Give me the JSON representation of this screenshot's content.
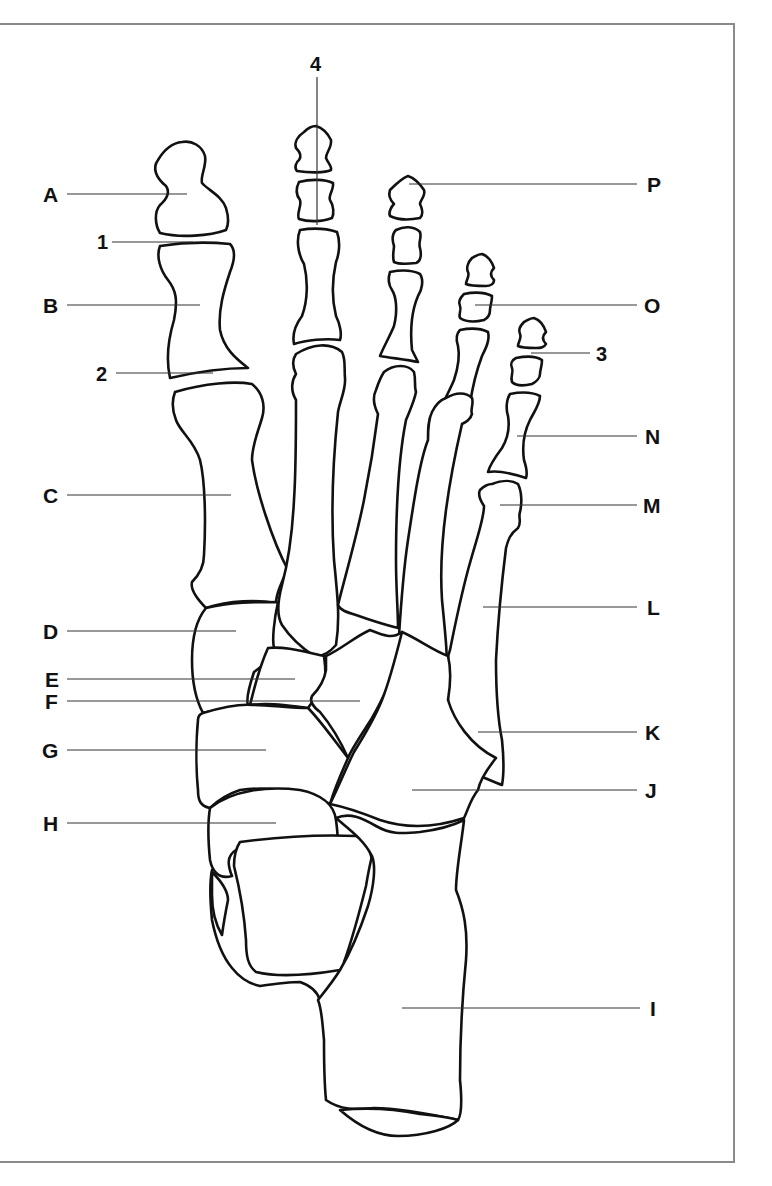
{
  "diagram": {
    "colors": {
      "line": "#111111",
      "leader": "#333333",
      "frame": "#8a8a8a",
      "background": "#ffffff"
    },
    "labels_left": [
      {
        "id": "A",
        "text": "A"
      },
      {
        "id": "1",
        "text": "1"
      },
      {
        "id": "B",
        "text": "B"
      },
      {
        "id": "2",
        "text": "2"
      },
      {
        "id": "C",
        "text": "C"
      },
      {
        "id": "D",
        "text": "D"
      },
      {
        "id": "E",
        "text": "E"
      },
      {
        "id": "F",
        "text": "F"
      },
      {
        "id": "G",
        "text": "G"
      },
      {
        "id": "H",
        "text": "H"
      }
    ],
    "labels_top": [
      {
        "id": "4",
        "text": "4"
      }
    ],
    "labels_right": [
      {
        "id": "P",
        "text": "P"
      },
      {
        "id": "O",
        "text": "O"
      },
      {
        "id": "3",
        "text": "3"
      },
      {
        "id": "N",
        "text": "N"
      },
      {
        "id": "M",
        "text": "M"
      },
      {
        "id": "L",
        "text": "L"
      },
      {
        "id": "K",
        "text": "K"
      },
      {
        "id": "J",
        "text": "J"
      },
      {
        "id": "I",
        "text": "I"
      }
    ]
  }
}
